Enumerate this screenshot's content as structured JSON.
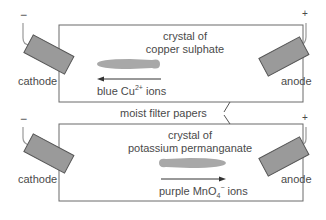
{
  "top_cell": {
    "crystal_label_line1": "crystal of",
    "crystal_label_line2": "copper sulphate",
    "ion_label_prefix": "blue Cu",
    "ion_charge": "2+",
    "ion_label_suffix": " ions",
    "arrow_direction": "left",
    "cathode_label": "cathode",
    "anode_label": "anode",
    "cathode_sign": "−",
    "anode_sign": "+"
  },
  "shared": {
    "filter_paper_label": "moist filter papers"
  },
  "bottom_cell": {
    "crystal_label_line1": "crystal of",
    "crystal_label_line2": "potassium permanganate",
    "ion_label_prefix": "purple MnO",
    "ion_subscript": "4",
    "ion_charge": "−",
    "ion_label_suffix": " ions",
    "arrow_direction": "right",
    "cathode_label": "cathode",
    "anode_label": "anode",
    "cathode_sign": "−",
    "anode_sign": "+"
  },
  "colors": {
    "line": "#6a6a6a",
    "electrode_fill": "#9a9a9a",
    "stain_fill": "#a8a8a8",
    "wire": "#999999",
    "text": "#4a4a4a"
  }
}
